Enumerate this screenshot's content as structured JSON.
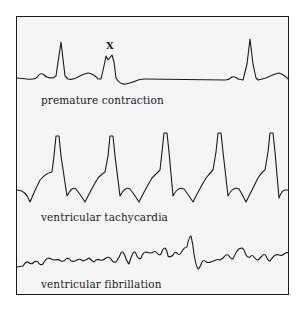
{
  "diagram": {
    "title": "",
    "panels": [
      {
        "id": "premature-contraction",
        "label": "premature contraction",
        "marker": "X"
      },
      {
        "id": "ventricular-tachycardia",
        "label": "ventricular tachycardia"
      },
      {
        "id": "ventricular-fibrillation",
        "label": "ventricular fibrillation"
      }
    ],
    "colors": {
      "trace": "#1a1a1a",
      "background": "#f5f5f5",
      "border": "#1a1a1a"
    }
  }
}
